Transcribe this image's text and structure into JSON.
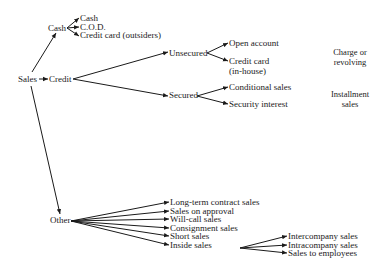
{
  "diagram": {
    "root": "Sales",
    "cash": {
      "label": "Cash",
      "children": [
        "Cash",
        "C.O.D.",
        "Credit card (outsiders)"
      ]
    },
    "credit": {
      "label": "Credit",
      "unsecured": {
        "label": "Unsecured",
        "children": [
          "Open account",
          "Credit card",
          "(in-house)"
        ]
      },
      "secured": {
        "label": "Secured",
        "children": [
          "Conditional sales",
          "Security interest"
        ]
      }
    },
    "other": {
      "label": "Other",
      "children": [
        "Long-term contract sales",
        "Sales on approval",
        "Will-call sales",
        "Consignment sales",
        "Short sales",
        "Inside sales"
      ]
    },
    "inside": {
      "children": [
        "Intercompany sales",
        "Intracompany sales",
        "Sales to employees"
      ]
    },
    "notes": {
      "charge_line1": "Charge or",
      "charge_line2": "revolving",
      "installment_line1": "Installment",
      "installment_line2": "sales"
    }
  }
}
